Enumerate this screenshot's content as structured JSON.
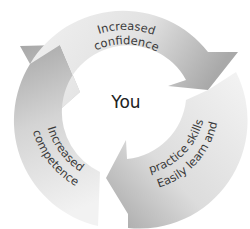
{
  "diagram": {
    "type": "cycle",
    "center": {
      "label": "You"
    },
    "segments": [
      {
        "id": "top",
        "line1": "Increased",
        "line2": "confidence"
      },
      {
        "id": "right",
        "line1": "Easily learn and",
        "line2": "practice skills"
      },
      {
        "id": "left",
        "line1": "Increased",
        "line2": "competence"
      }
    ],
    "colors": {
      "light": "#f0f0f0",
      "dark": "#a8a8a8",
      "text": "#3a3a3a"
    }
  }
}
